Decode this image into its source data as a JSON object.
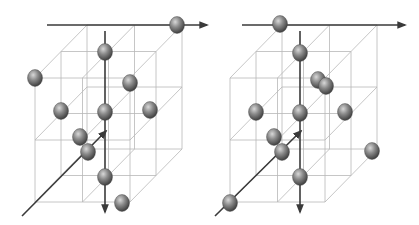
{
  "figure": {
    "colors": {
      "grid_line": "#b8b8b8",
      "axis_line": "#3a3a3a",
      "atom_light": "#d8d8d8",
      "atom_mid": "#8a8a8a",
      "atom_dark": "#3c3c3c"
    },
    "panels": [
      {
        "name": "left-lattice",
        "origin": [
          35,
          202
        ],
        "width_vec": [
          95,
          0
        ],
        "height_vec": [
          0,
          -124
        ],
        "depth_vec": [
          52,
          -53
        ],
        "axes": {
          "horizontal": [
            47,
            25,
            207,
            25
          ],
          "vertical": [
            105,
            31,
            105,
            212
          ],
          "diagonal": [
            22,
            216,
            106,
            131
          ]
        },
        "atoms": [
          [
            177,
            25
          ],
          [
            105,
            52
          ],
          [
            35,
            78
          ],
          [
            130,
            83
          ],
          [
            61,
            111
          ],
          [
            105,
            112
          ],
          [
            150,
            110
          ],
          [
            80,
            137
          ],
          [
            88,
            152
          ],
          [
            105,
            177
          ],
          [
            122,
            203
          ]
        ]
      },
      {
        "name": "right-lattice",
        "origin": [
          230,
          202
        ],
        "width_vec": [
          95,
          0
        ],
        "height_vec": [
          0,
          -124
        ],
        "depth_vec": [
          52,
          -53
        ],
        "axes": {
          "horizontal": [
            242,
            25,
            405,
            25
          ],
          "vertical": [
            300,
            31,
            300,
            212
          ],
          "diagonal": [
            215,
            216,
            301,
            131
          ]
        },
        "atoms": [
          [
            280,
            24
          ],
          [
            300,
            53
          ],
          [
            318,
            80
          ],
          [
            326,
            86
          ],
          [
            256,
            112
          ],
          [
            300,
            113
          ],
          [
            345,
            112
          ],
          [
            274,
            137
          ],
          [
            282,
            152
          ],
          [
            372,
            151
          ],
          [
            300,
            177
          ],
          [
            230,
            203
          ]
        ]
      }
    ]
  }
}
